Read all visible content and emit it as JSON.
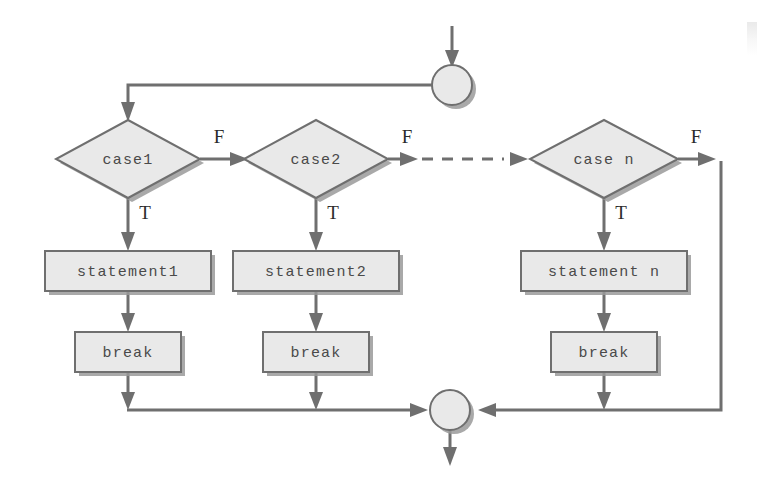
{
  "diagram": {
    "type": "flowchart",
    "nodes": {
      "entry_connector": {
        "label": "",
        "shape": "circle"
      },
      "exit_connector": {
        "label": "",
        "shape": "circle"
      },
      "case1": {
        "label": "case1",
        "shape": "diamond"
      },
      "case2": {
        "label": "case2",
        "shape": "diamond"
      },
      "case_n": {
        "label": "case n",
        "shape": "diamond"
      },
      "statement1": {
        "label": "statement1",
        "shape": "rect"
      },
      "statement2": {
        "label": "statement2",
        "shape": "rect"
      },
      "statement_n": {
        "label": "statement n",
        "shape": "rect"
      },
      "break1": {
        "label": "break",
        "shape": "rect"
      },
      "break2": {
        "label": "break",
        "shape": "rect"
      },
      "break_n": {
        "label": "break",
        "shape": "rect"
      }
    },
    "branch_labels": {
      "case1_false": "F",
      "case1_true": "T",
      "case2_false": "F",
      "case2_true": "T",
      "case_n_false": "F",
      "case_n_true": "T"
    },
    "colors": {
      "shape_fill": "#e9e9e9",
      "shape_stroke": "#6f6f6f",
      "shape_shadow": "#9a9a9a",
      "edge": "#6f6f6f",
      "mono_text": "#4a4a4a",
      "branch_text": "#2b2b2b",
      "background": "#ffffff"
    }
  }
}
